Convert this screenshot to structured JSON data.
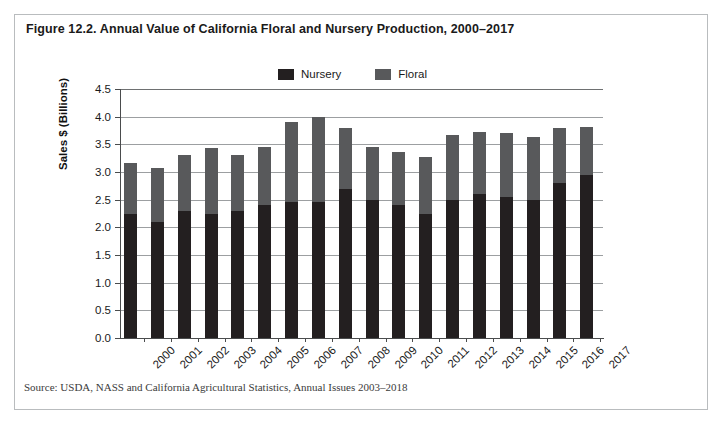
{
  "figure": {
    "title": "Figure 12.2. Annual Value of California Floral and Nursery Production, 2000–2017",
    "source": "Source: USDA, NASS and California Agricultural Statistics, Annual Issues 2003–2018"
  },
  "colors": {
    "nursery": "#231f20",
    "floral": "#58595b",
    "gridline": "#9c9fa1",
    "axis": "#4a4c4d",
    "frame": "#b9bcbe"
  },
  "chart_data": {
    "type": "bar",
    "stacked": true,
    "title": "Figure 12.2. Annual Value of California Floral and Nursery Production, 2000–2017",
    "xlabel": "",
    "ylabel": "Sales $ (Billions)",
    "ylim": [
      0.0,
      4.5
    ],
    "yticks": [
      "0.0",
      "0.5",
      "1.0",
      "1.5",
      "2.0",
      "2.5",
      "3.0",
      "3.5",
      "4.0",
      "4.5"
    ],
    "ytick_values": [
      0.0,
      0.5,
      1.0,
      1.5,
      2.0,
      2.5,
      3.0,
      3.5,
      4.0,
      4.5
    ],
    "grid": true,
    "legend_position": "top-center",
    "categories": [
      "2000",
      "2001",
      "2002",
      "2003",
      "2004",
      "2005",
      "2006",
      "2007",
      "2008",
      "2009",
      "2010",
      "2011",
      "2012",
      "2013",
      "2014",
      "2015",
      "2016",
      "2017"
    ],
    "series": [
      {
        "name": "Nursery",
        "color": "#231f20",
        "values": [
          2.25,
          2.1,
          2.3,
          2.25,
          2.3,
          2.4,
          2.45,
          2.45,
          2.7,
          2.5,
          2.4,
          2.25,
          2.5,
          2.6,
          2.55,
          2.5,
          2.8,
          2.95
        ]
      },
      {
        "name": "Floral",
        "color": "#58595b",
        "values": [
          0.92,
          0.97,
          1.0,
          1.18,
          1.01,
          1.06,
          1.45,
          1.55,
          1.1,
          0.95,
          0.97,
          1.03,
          1.17,
          1.12,
          1.15,
          1.14,
          1.0,
          0.87
        ]
      }
    ],
    "totals": [
      3.17,
      3.07,
      3.3,
      3.43,
      3.31,
      3.46,
      3.9,
      4.0,
      3.8,
      3.45,
      3.37,
      3.28,
      3.67,
      3.72,
      3.7,
      3.64,
      3.8,
      3.82
    ]
  }
}
